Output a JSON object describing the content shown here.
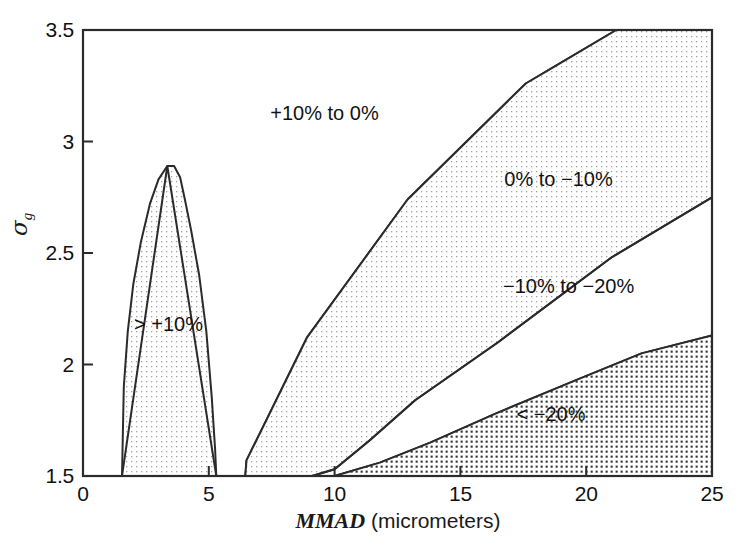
{
  "chart_data": {
    "type": "area",
    "title": "",
    "xlabel": "MMAD (micrometers)",
    "ylabel": "σg",
    "xlim": [
      0,
      25
    ],
    "ylim": [
      1.5,
      3.5
    ],
    "xticks": [
      "0",
      "5",
      "10",
      "15",
      "20",
      "25"
    ],
    "xtick_values": [
      0,
      5,
      10,
      15,
      20,
      25
    ],
    "yticks": [
      "1.5",
      "2",
      "2.5",
      "3",
      "3.5"
    ],
    "ytick_values": [
      1.5,
      2,
      2.5,
      3,
      3.5
    ],
    "grid": false,
    "legend_position": "inline-annotations",
    "regions": [
      {
        "label": "> +10%",
        "fill": "light-stipple",
        "label_x": 3.4,
        "label_y": 2.18,
        "polygon": [
          [
            1.55,
            1.5
          ],
          [
            1.62,
            1.9
          ],
          [
            1.78,
            2.15
          ],
          [
            2.0,
            2.36
          ],
          [
            2.3,
            2.55
          ],
          [
            2.66,
            2.72
          ],
          [
            3.0,
            2.83
          ],
          [
            3.35,
            2.89
          ],
          [
            3.62,
            2.89
          ],
          [
            3.86,
            2.84
          ],
          [
            4.05,
            2.74
          ],
          [
            4.3,
            2.6
          ],
          [
            4.62,
            2.4
          ],
          [
            4.9,
            2.15
          ],
          [
            5.12,
            1.85
          ],
          [
            5.25,
            1.62
          ],
          [
            5.3,
            1.5
          ]
        ]
      },
      {
        "label": "+10% to 0%",
        "fill": "none",
        "label_x": 9.6,
        "label_y": 3.13,
        "polygon": [
          [
            0,
            1.5
          ],
          [
            1.55,
            1.5
          ],
          [
            3.35,
            2.89
          ],
          [
            5.3,
            1.5
          ],
          [
            6.45,
            1.5
          ],
          [
            6.5,
            1.57
          ],
          [
            8.9,
            2.12
          ],
          [
            12.9,
            2.74
          ],
          [
            17.6,
            3.26
          ],
          [
            18.5,
            3.32
          ],
          [
            21.2,
            3.5
          ],
          [
            0,
            3.5
          ]
        ]
      },
      {
        "label": "0% to −10%",
        "fill": "light-stipple",
        "label_x": 18.9,
        "label_y": 2.83,
        "polygon": [
          [
            6.45,
            1.5
          ],
          [
            6.5,
            1.57
          ],
          [
            8.9,
            2.12
          ],
          [
            12.9,
            2.74
          ],
          [
            17.6,
            3.26
          ],
          [
            18.5,
            3.32
          ],
          [
            21.2,
            3.5
          ],
          [
            25,
            3.5
          ],
          [
            25,
            2.75
          ],
          [
            21.0,
            2.48
          ],
          [
            16.5,
            2.1
          ],
          [
            13.2,
            1.84
          ],
          [
            11.4,
            1.66
          ],
          [
            10.0,
            1.53
          ],
          [
            9.1,
            1.5
          ]
        ]
      },
      {
        "label": "−10% to −20%",
        "fill": "none",
        "label_x": 19.3,
        "label_y": 2.35,
        "polygon": [
          [
            9.1,
            1.5
          ],
          [
            10.0,
            1.53
          ],
          [
            11.4,
            1.66
          ],
          [
            13.2,
            1.84
          ],
          [
            16.5,
            2.1
          ],
          [
            21.0,
            2.48
          ],
          [
            25,
            2.75
          ],
          [
            25,
            2.13
          ],
          [
            22.2,
            2.05
          ],
          [
            19.6,
            1.93
          ],
          [
            16.4,
            1.78
          ],
          [
            13.8,
            1.65
          ],
          [
            11.8,
            1.56
          ],
          [
            10.0,
            1.5
          ]
        ]
      },
      {
        "label": "< −20%",
        "fill": "dense-stipple",
        "label_x": 18.6,
        "label_y": 1.78,
        "polygon": [
          [
            10.0,
            1.5
          ],
          [
            11.8,
            1.56
          ],
          [
            13.8,
            1.65
          ],
          [
            16.4,
            1.78
          ],
          [
            19.6,
            1.93
          ],
          [
            22.2,
            2.05
          ],
          [
            25,
            2.13
          ],
          [
            25,
            1.5
          ]
        ]
      }
    ]
  },
  "axes": {
    "x_tick_labels": [
      "0",
      "5",
      "10",
      "15",
      "20",
      "25"
    ],
    "y_tick_labels": [
      "1.5",
      "2",
      "2.5",
      "3",
      "3.5"
    ],
    "x_axis_title": "MMAD (micrometers)",
    "x_axis_title_italic_part": "MMAD",
    "x_axis_title_rest": " (micrometers)",
    "y_axis_symbol": "σ",
    "y_axis_subscript": "g"
  },
  "annotations": {
    "r1": "> +10%",
    "r2": "+10% to 0%",
    "r3": "0% to −10%",
    "r4": "−10% to −20%",
    "r5": "< −20%"
  },
  "colors": {
    "axis": "#2b2b2b",
    "text": "#111111",
    "stipple_light": "#9a9a9a",
    "stipple_dense": "#2e2e2e",
    "background": "#ffffff"
  }
}
